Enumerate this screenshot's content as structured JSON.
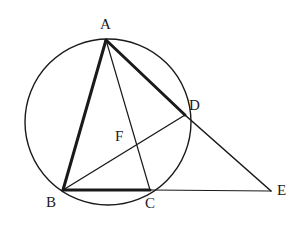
{
  "figure": {
    "canvas": {
      "width": 304,
      "height": 236,
      "background": "#ffffff"
    },
    "stroke_color": "#1a1a1a",
    "circle": {
      "name": "circumcircle",
      "cx": 108,
      "cy": 122,
      "r": 83,
      "stroke_width": 1.4,
      "fill": "none"
    },
    "points": [
      {
        "id": "A",
        "label": "A",
        "x": 106,
        "y": 40,
        "label_x": 100,
        "label_y": 17
      },
      {
        "id": "B",
        "label": "B",
        "x": 63,
        "y": 190,
        "label_x": 46,
        "label_y": 195
      },
      {
        "id": "C",
        "label": "C",
        "x": 150,
        "y": 190,
        "label_x": 145,
        "label_y": 196
      },
      {
        "id": "D",
        "label": "D",
        "x": 185,
        "y": 115,
        "label_x": 189,
        "label_y": 98
      },
      {
        "id": "E",
        "label": "E",
        "x": 271,
        "y": 191,
        "label_x": 277,
        "label_y": 183
      },
      {
        "id": "F",
        "label": "F",
        "x": 132,
        "y": 145,
        "label_x": 115,
        "label_y": 129
      }
    ],
    "segments": [
      {
        "id": "AB",
        "from": "A",
        "to": "B",
        "x1": 106,
        "y1": 40,
        "x2": 63,
        "y2": 190,
        "stroke_width": 3.0,
        "weight": "thick"
      },
      {
        "id": "AD",
        "from": "A",
        "to": "D",
        "x1": 106,
        "y1": 40,
        "x2": 185,
        "y2": 115,
        "stroke_width": 3.0,
        "weight": "thick"
      },
      {
        "id": "BC",
        "from": "B",
        "to": "C",
        "x1": 63,
        "y1": 190,
        "x2": 150,
        "y2": 190,
        "stroke_width": 3.0,
        "weight": "thick"
      },
      {
        "id": "AC",
        "from": "A",
        "to": "C",
        "x1": 106,
        "y1": 40,
        "x2": 150,
        "y2": 190,
        "stroke_width": 1.2,
        "weight": "thin"
      },
      {
        "id": "BD",
        "from": "B",
        "to": "D",
        "x1": 63,
        "y1": 190,
        "x2": 185,
        "y2": 115,
        "stroke_width": 1.4,
        "weight": "medium"
      },
      {
        "id": "DE",
        "from": "D",
        "to": "E",
        "x1": 185,
        "y1": 115,
        "x2": 271,
        "y2": 191,
        "stroke_width": 1.6,
        "weight": "medium"
      },
      {
        "id": "CE",
        "from": "C",
        "to": "E",
        "x1": 150,
        "y1": 190,
        "x2": 271,
        "y2": 191,
        "stroke_width": 1.2,
        "weight": "thin"
      }
    ]
  }
}
